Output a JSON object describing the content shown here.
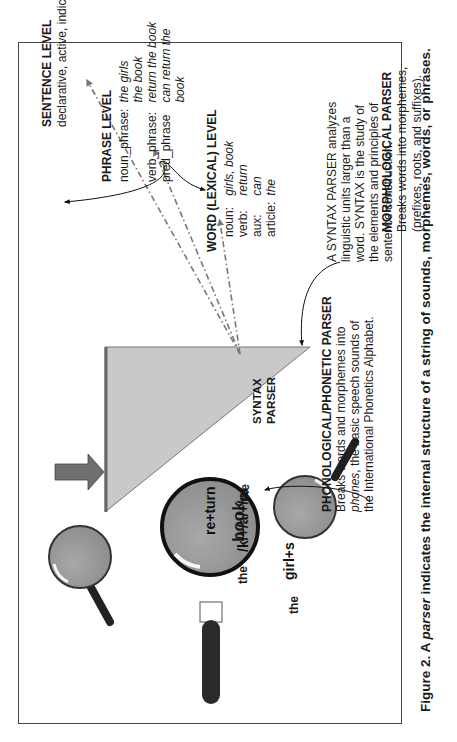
{
  "figure": {
    "caption_prefix": "Figure 2.  A ",
    "caption_italic": "parser",
    "caption_suffix": " indicates the internal structure of a string of sounds, morphemes, words, or phrases."
  },
  "sentence_level": {
    "title": "SENTENCE LEVEL",
    "desc": "declarative, active, indicative"
  },
  "phrase_level": {
    "title": "PHRASE LEVEL",
    "rows": [
      {
        "label": "noun_phrase:",
        "value": "the girls\nthe book"
      },
      {
        "label": "verb_phrase:",
        "value": "return the book"
      },
      {
        "label": "pred_phrase",
        "value": "can return the book"
      }
    ]
  },
  "word_level": {
    "title": "WORD (LEXICAL) LEVEL",
    "rows": [
      {
        "label": "noun:",
        "value": "girls, book"
      },
      {
        "label": "verb:",
        "value": "return"
      },
      {
        "label": "aux:",
        "value": "can"
      },
      {
        "label": "article:",
        "value": "the"
      }
    ]
  },
  "syntax_parser": {
    "label_line1": "SYNTAX",
    "label_line2": "PARSER",
    "note_lines": [
      "A SYNTAX PARSER analyzes",
      "linguistic units larger than a",
      "word.  SYNTAX is the study of",
      "the elements and principles of",
      "sentence construction."
    ],
    "input_word": "book",
    "input_prefix": "the"
  },
  "morphological_parser": {
    "title": "MORPHOLOGICAL PARSER",
    "lines": [
      "Breaks words into morphemes,",
      "(prefixes, roots, and suffixes)."
    ],
    "magnifier_left_text": "girl+s",
    "magnifier_left_prefix": "the",
    "magnifier_right_text": "re+turn",
    "magnifier_right_suffix": "the"
  },
  "phonological_parser": {
    "title": "PHONOLOGICAL/PHONETIC PARSER",
    "line1": "Breaks words and morphemes into",
    "line2_italic": "phones",
    "line2_rest": ", the basic speech sounds of",
    "line3": "the International Phonetics Alphabet.",
    "magnifier_text": "/k/+/a/+/n/"
  },
  "colors": {
    "triangle_fill": "#c8c8c8",
    "triangle_edge": "#555555",
    "lens_fill": "#9a9a9a",
    "arrow_gray": "#777777",
    "handle": "#222222"
  }
}
